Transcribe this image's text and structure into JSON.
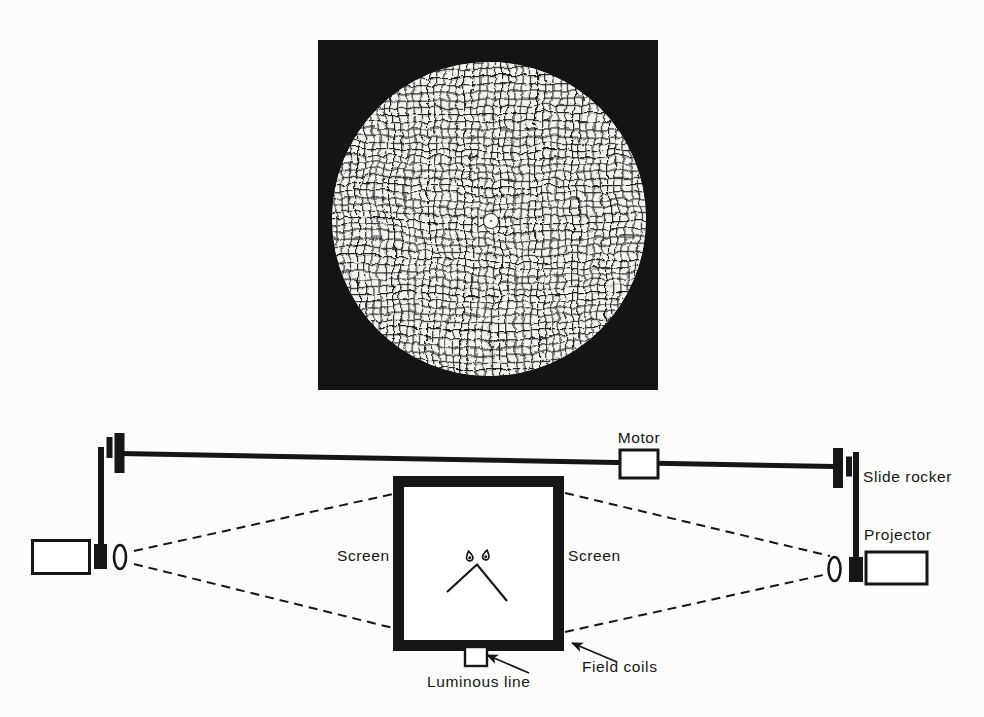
{
  "page": {
    "background_color": "#fcfcfb",
    "ink_color": "#161616"
  },
  "photo": {
    "name": "distorted-grid-photograph",
    "frame_color": "#141414",
    "mesh_line_color": "#181818",
    "mesh_paper_color": "#f5f4f0",
    "fixation_dot_color": "#f8f8f5"
  },
  "apparatus": {
    "labels": {
      "motor": "Motor",
      "slide_rocker": "Slide rocker",
      "projector": "Projector",
      "screen_left": "Screen",
      "screen_right": "Screen",
      "field_coils": "Field coils",
      "luminous_line": "Luminous line"
    }
  }
}
